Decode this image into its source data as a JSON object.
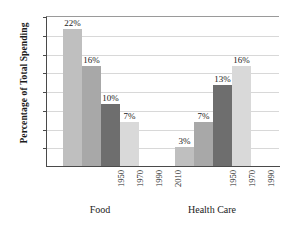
{
  "chart_data": {
    "type": "bar",
    "title": "",
    "xlabel": "",
    "ylabel": "Percentage of Total Spending",
    "ylim": [
      0,
      24
    ],
    "ytick_values": [
      3,
      6,
      9,
      12,
      15,
      18,
      21,
      24
    ],
    "ytick_labels": [
      "3%",
      "6%",
      "9%",
      "12%",
      "15%",
      "18%",
      "21%",
      "24%"
    ],
    "grid": true,
    "legend": "none",
    "categories": [
      "1950",
      "1970",
      "1990",
      "2010"
    ],
    "groups": [
      {
        "name": "Food",
        "values": [
          22,
          16,
          10,
          7
        ],
        "value_labels": [
          "22%",
          "16%",
          "10%",
          "7%"
        ]
      },
      {
        "name": "Health Care",
        "values": [
          3,
          7,
          13,
          16
        ],
        "value_labels": [
          "3%",
          "7%",
          "13%",
          "16%"
        ]
      }
    ],
    "series_colors": [
      "#bfbfbf",
      "#a8a8a8",
      "#6e6e6e",
      "#d9d9d9"
    ]
  }
}
